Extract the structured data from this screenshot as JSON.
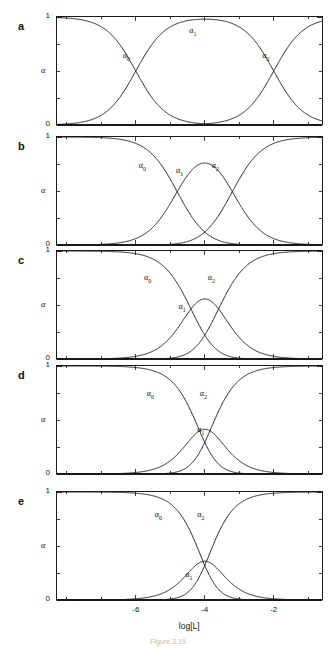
{
  "figure": {
    "caption": "Figure 3.19",
    "xaxis": {
      "title": "log[L]",
      "min": -8.3,
      "max": -0.6,
      "ticks": [
        -6,
        -4,
        -2
      ],
      "tick_labels": [
        "-6",
        "-4",
        "-2"
      ],
      "minor_ticks": [
        -8,
        -7,
        -6,
        -5,
        -4,
        -3,
        -2,
        -1
      ]
    },
    "yaxis": {
      "title": "α",
      "min": 0,
      "max": 1,
      "tick_labels": [
        "0",
        "1"
      ],
      "minor_ticks": [
        0,
        0.25,
        0.5,
        0.75,
        1
      ]
    },
    "series_labels": {
      "alpha0": "α",
      "alpha0_sub": "0",
      "alpha1": "α",
      "alpha1_sub": "1",
      "alpha2": "α",
      "alpha2_sub": "2"
    }
  },
  "panels": [
    {
      "letter": "a",
      "ylabel": "α",
      "y_low": "0",
      "y_high": "1",
      "label_positions": {
        "a0x": 0.265,
        "a0y": 0.63,
        "a1x": 0.515,
        "a1y": 0.86,
        "a2x": 0.79,
        "a2y": 0.63
      }
    },
    {
      "letter": "b",
      "ylabel": "α",
      "y_low": "0",
      "y_high": "1",
      "label_positions": {
        "a0x": 0.325,
        "a0y": 0.72,
        "a1x": 0.465,
        "a1y": 0.68,
        "a2x": 0.6,
        "a2y": 0.72
      }
    },
    {
      "letter": "c",
      "ylabel": "α",
      "y_low": "0",
      "y_high": "1",
      "label_positions": {
        "a0x": 0.345,
        "a0y": 0.745,
        "a1x": 0.475,
        "a1y": 0.47,
        "a2x": 0.585,
        "a2y": 0.745
      }
    },
    {
      "letter": "d",
      "ylabel": "α",
      "y_low": "0",
      "y_high": "1",
      "label_positions": {
        "a0x": 0.355,
        "a0y": 0.73,
        "a1x": 0.545,
        "a1y": 0.4,
        "a2x": 0.555,
        "a2y": 0.73
      }
    },
    {
      "letter": "e",
      "ylabel": "α",
      "y_low": "0",
      "y_high": "1",
      "label_positions": {
        "a0x": 0.385,
        "a0y": 0.78,
        "a1x": 0.5,
        "a1y": 0.22,
        "a2x": 0.545,
        "a2y": 0.78
      }
    }
  ],
  "chart_data": {
    "type": "line",
    "title": "",
    "xlabel": "log[L]",
    "ylabel": "α",
    "xlim": [
      -8.3,
      -0.6
    ],
    "ylim": [
      0,
      1
    ],
    "grid": false,
    "legend": "inline-curve-labels",
    "panels": [
      {
        "letter": "a",
        "logK1": -6.0,
        "logK2": -2.0,
        "x": [
          -8.3,
          -8.0,
          -7.5,
          -7.0,
          -6.5,
          -6.0,
          -5.5,
          -5.0,
          -4.5,
          -4.0,
          -3.5,
          -3.0,
          -2.5,
          -2.0,
          -1.5,
          -1.0,
          -0.6
        ],
        "series": [
          {
            "name": "α0",
            "values": [
              0.995,
              0.99,
              0.969,
              0.909,
              0.76,
              0.5,
              0.24,
              0.091,
              0.031,
              0.01,
              0.003,
              0.001,
              0.0,
              0.0,
              0.0,
              0.0,
              0.0
            ]
          },
          {
            "name": "α1",
            "values": [
              0.005,
              0.01,
              0.031,
              0.091,
              0.24,
              0.5,
              0.76,
              0.909,
              0.969,
              0.98,
              0.969,
              0.909,
              0.76,
              0.5,
              0.24,
              0.091,
              0.038
            ]
          },
          {
            "name": "α2",
            "values": [
              0.0,
              0.0,
              0.0,
              0.0,
              0.0,
              0.0,
              0.0,
              0.0,
              0.0,
              0.01,
              0.028,
              0.09,
              0.24,
              0.5,
              0.76,
              0.909,
              0.962
            ]
          }
        ]
      },
      {
        "letter": "b",
        "logK1": -4.8,
        "logK2": -3.2,
        "x": [
          -8.3,
          -8.0,
          -7.5,
          -7.0,
          -6.5,
          -6.0,
          -5.5,
          -5.0,
          -4.5,
          -4.0,
          -3.5,
          -3.0,
          -2.5,
          -2.0,
          -1.5,
          -1.0,
          -0.6
        ],
        "series": [
          {
            "name": "α0",
            "values": [
              1.0,
              1.0,
              0.998,
              0.994,
              0.981,
              0.941,
              0.833,
              0.614,
              0.333,
              0.12,
              0.032,
              0.007,
              0.001,
              0.0,
              0.0,
              0.0,
              0.0
            ]
          },
          {
            "name": "α1",
            "values": [
              0.0,
              0.0,
              0.002,
              0.006,
              0.019,
              0.059,
              0.163,
              0.353,
              0.487,
              0.43,
              0.27,
              0.128,
              0.05,
              0.017,
              0.006,
              0.002,
              0.001
            ]
          },
          {
            "name": "α2",
            "values": [
              0.0,
              0.0,
              0.0,
              0.0,
              0.0,
              0.0,
              0.004,
              0.033,
              0.18,
              0.45,
              0.698,
              0.865,
              0.949,
              0.983,
              0.994,
              0.998,
              0.999
            ]
          }
        ]
      },
      {
        "letter": "c",
        "logK1": -4.4,
        "logK2": -3.6,
        "x": [
          -8.3,
          -8.0,
          -7.5,
          -7.0,
          -6.5,
          -6.0,
          -5.5,
          -5.0,
          -4.5,
          -4.0,
          -3.5,
          -3.0,
          -2.5,
          -2.0,
          -1.5,
          -1.0,
          -0.6
        ],
        "series": [
          {
            "name": "α0",
            "values": [
              1.0,
              1.0,
              1.0,
              0.999,
              0.996,
              0.988,
              0.962,
              0.889,
              0.7,
              0.42,
              0.17,
              0.052,
              0.014,
              0.004,
              0.001,
              0.0,
              0.0
            ]
          },
          {
            "name": "α1",
            "values": [
              0.0,
              0.0,
              0.0,
              0.001,
              0.004,
              0.012,
              0.037,
              0.105,
              0.234,
              0.3,
              0.228,
              0.113,
              0.045,
              0.016,
              0.005,
              0.002,
              0.001
            ]
          },
          {
            "name": "α2",
            "values": [
              0.0,
              0.0,
              0.0,
              0.0,
              0.0,
              0.0,
              0.001,
              0.006,
              0.066,
              0.28,
              0.602,
              0.835,
              0.941,
              0.98,
              0.994,
              0.998,
              0.999
            ]
          }
        ]
      },
      {
        "letter": "d",
        "logK1": -4.15,
        "logK2": -3.85,
        "x": [
          -8.3,
          -8.0,
          -7.5,
          -7.0,
          -6.5,
          -6.0,
          -5.5,
          -5.0,
          -4.5,
          -4.0,
          -3.5,
          -3.0,
          -2.5,
          -2.0,
          -1.5,
          -1.0,
          -0.6
        ],
        "series": [
          {
            "name": "α0",
            "values": [
              1.0,
              1.0,
              1.0,
              1.0,
              0.999,
              0.997,
              0.99,
              0.969,
              0.9,
              0.5,
              0.14,
              0.032,
              0.009,
              0.003,
              0.001,
              0.0,
              0.0
            ]
          },
          {
            "name": "α1",
            "values": [
              0.0,
              0.0,
              0.0,
              0.0,
              0.001,
              0.003,
              0.009,
              0.028,
              0.082,
              0.2,
              0.11,
              0.038,
              0.013,
              0.004,
              0.001,
              0.0,
              0.0
            ]
          },
          {
            "name": "α2",
            "values": [
              0.0,
              0.0,
              0.0,
              0.0,
              0.0,
              0.0,
              0.001,
              0.003,
              0.018,
              0.3,
              0.75,
              0.93,
              0.978,
              0.993,
              0.998,
              1.0,
              1.0
            ]
          }
        ]
      },
      {
        "letter": "e",
        "logK1": -4.05,
        "logK2": -3.95,
        "x": [
          -8.3,
          -8.0,
          -7.5,
          -7.0,
          -6.5,
          -6.0,
          -5.5,
          -5.0,
          -4.5,
          -4.0,
          -3.5,
          -3.0,
          -2.5,
          -2.0,
          -1.5,
          -1.0,
          -0.6
        ],
        "series": [
          {
            "name": "α0",
            "values": [
              1.0,
              1.0,
              1.0,
              1.0,
              1.0,
              0.999,
              0.997,
              0.99,
              0.955,
              0.5,
              0.06,
              0.012,
              0.003,
              0.001,
              0.0,
              0.0,
              0.0
            ]
          },
          {
            "name": "α1",
            "values": [
              0.0,
              0.0,
              0.0,
              0.0,
              0.0,
              0.001,
              0.003,
              0.01,
              0.037,
              0.1,
              0.04,
              0.012,
              0.004,
              0.001,
              0.0,
              0.0,
              0.0
            ]
          },
          {
            "name": "α2",
            "values": [
              0.0,
              0.0,
              0.0,
              0.0,
              0.0,
              0.0,
              0.0,
              0.0,
              0.008,
              0.4,
              0.9,
              0.976,
              0.993,
              0.998,
              1.0,
              1.0,
              1.0
            ]
          }
        ]
      }
    ]
  }
}
